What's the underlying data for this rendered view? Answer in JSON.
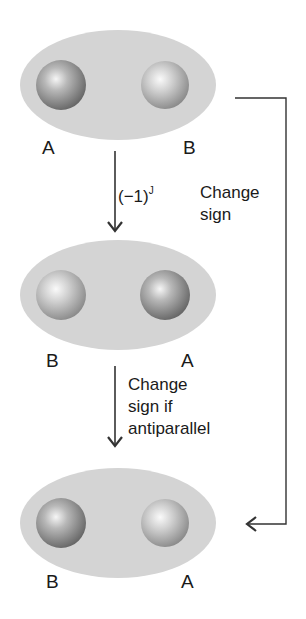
{
  "diagram": {
    "colors": {
      "ellipse": "#d4d4d4",
      "sphere_light": "#f4f4f4",
      "sphere_dark": "#6e6e6e",
      "line": "#333333"
    },
    "states": [
      {
        "left_label": "A",
        "right_label": "B"
      },
      {
        "left_label": "B",
        "right_label": "A"
      },
      {
        "left_label": "B",
        "right_label": "A"
      }
    ],
    "arrows": {
      "step1": {
        "label_base": "(−1)",
        "label_sup": "J"
      },
      "step2": {
        "line1": "Change",
        "line2": "sign if",
        "line3": "antiparallel"
      },
      "direct": {
        "line1": "Change",
        "line2": "sign"
      }
    }
  }
}
